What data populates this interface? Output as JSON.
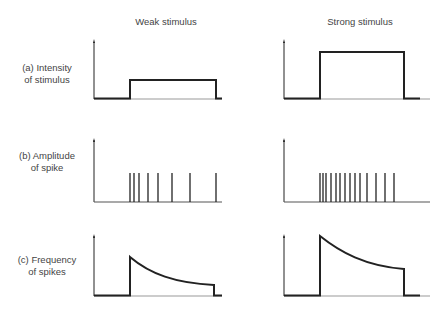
{
  "columns": {
    "weak": "Weak stimulus",
    "strong": "Strong stimulus"
  },
  "rows": [
    {
      "label_line1": "(a) Intensity",
      "label_line2": "of stimulus"
    },
    {
      "label_line1": "(b) Amplitude",
      "label_line2": "of spike"
    },
    {
      "label_line1": "(c) Frequency",
      "label_line2": "of spikes"
    }
  ],
  "colors": {
    "line": "#222222",
    "text": "#444444"
  },
  "diagram": {
    "weak": {
      "intensity_pulse": {
        "start_x": 130,
        "end_x": 216,
        "level": "low"
      },
      "spike_x": [
        130,
        134,
        139,
        148,
        158,
        172,
        190,
        216
      ],
      "frequency_curve": {
        "start_x": 130,
        "end_x": 216,
        "peak": "moderate",
        "decay": "exponential"
      }
    },
    "strong": {
      "intensity_pulse": {
        "start_x": 320,
        "end_x": 404,
        "level": "high"
      },
      "spike_x": [
        320,
        323,
        326,
        331,
        336,
        340,
        345,
        350,
        355,
        360,
        367,
        376,
        385,
        394
      ],
      "frequency_curve": {
        "start_x": 320,
        "end_x": 404,
        "peak": "high",
        "decay": "exponential"
      }
    }
  }
}
